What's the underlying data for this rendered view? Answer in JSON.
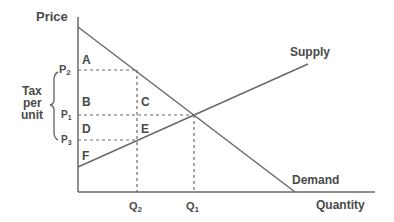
{
  "diagram": {
    "axes": {
      "y_label": "Price",
      "x_label": "Quantity"
    },
    "curves": {
      "supply_label": "Supply",
      "demand_label": "Demand"
    },
    "price_levels": {
      "p2": "P",
      "p2_sub": "2",
      "p1": "P",
      "p1_sub": "1",
      "p3": "P",
      "p3_sub": "3"
    },
    "quantity_levels": {
      "q2": "Q",
      "q2_sub": "2",
      "q1": "Q",
      "q1_sub": "1"
    },
    "tax_bracket": {
      "line1": "Tax",
      "line2": "per",
      "line3": "unit"
    },
    "areas": {
      "a": "A",
      "b": "B",
      "c": "C",
      "d": "D",
      "e": "E",
      "f": "F"
    },
    "colors": {
      "line": "#6a6a6a",
      "text": "#4a4a4a",
      "background": "#ffffff"
    }
  }
}
